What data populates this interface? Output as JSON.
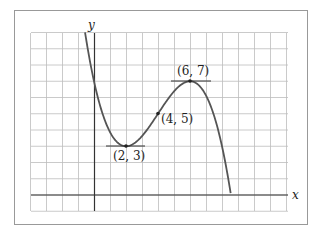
{
  "chart_data": {
    "type": "line",
    "title": "",
    "xlabel": "x",
    "ylabel": "y",
    "function": "f(x) = -(x-4)^3/8 + 1.5(x-4) + 5",
    "xlim": [
      -4,
      12
    ],
    "ylim": [
      -1,
      10
    ],
    "grid": true,
    "legend": null,
    "series": [
      {
        "name": "f(x)",
        "x": [
          -0.56,
          0,
          1,
          2,
          3,
          4,
          5,
          6,
          7,
          8,
          8.55
        ],
        "y": [
          10.0,
          7.0,
          4.375,
          3.0,
          3.625,
          5.0,
          6.375,
          7.0,
          5.625,
          3.0,
          -0.1
        ]
      }
    ],
    "annotations": [
      {
        "label": "(2, 3)",
        "x": 2,
        "y": 3,
        "type": "local minimum",
        "tangent": "horizontal"
      },
      {
        "label": "(4, 5)",
        "x": 4,
        "y": 5,
        "type": "inflection point"
      },
      {
        "label": "(6, 7)",
        "x": 6,
        "y": 7,
        "type": "local maximum",
        "tangent": "horizontal"
      }
    ]
  },
  "labels": {
    "x_axis": "x",
    "y_axis": "y",
    "point_min": "(2, 3)",
    "point_inflection": "(4, 5)",
    "point_max": "(6, 7)"
  },
  "colors": {
    "grid": "#bdbdbd",
    "axis": "#333333",
    "curve": "#555555",
    "frame": "#999999"
  }
}
